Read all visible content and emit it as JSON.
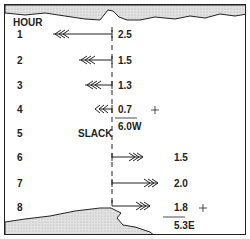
{
  "diagram": {
    "header": "HOUR",
    "slack_label": "SLACK",
    "hours": [
      {
        "hour": "1",
        "speed": "2.5",
        "direction": "west"
      },
      {
        "hour": "2",
        "speed": "1.5",
        "direction": "west"
      },
      {
        "hour": "3",
        "speed": "1.3",
        "direction": "west"
      },
      {
        "hour": "4",
        "speed": "0.7",
        "direction": "west"
      },
      {
        "hour": "5",
        "speed": "",
        "direction": "slack"
      },
      {
        "hour": "6",
        "speed": "1.5",
        "direction": "east"
      },
      {
        "hour": "7",
        "speed": "2.0",
        "direction": "east"
      },
      {
        "hour": "8",
        "speed": "1.8",
        "direction": "east"
      }
    ],
    "sums": [
      {
        "symbol": "+",
        "total": "6.0W"
      },
      {
        "symbol": "+",
        "total": "5.3E"
      }
    ],
    "colors": {
      "line": "#222222",
      "land": "#d6d6d6"
    }
  }
}
